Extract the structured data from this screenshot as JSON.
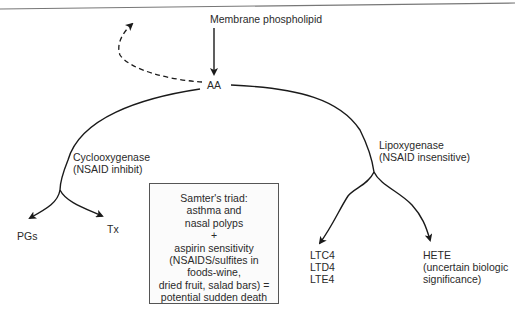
{
  "diagram": {
    "source": "Membrane phospholipid",
    "center_node": "AA",
    "left_branch": {
      "enzyme": "Cyclooxygenase",
      "note": "(NSAID inhibit)",
      "products": [
        "PGs",
        "Tx"
      ]
    },
    "right_branch": {
      "enzyme": "Lipoxygenase",
      "note": "(NSAID insensitive)",
      "products": {
        "leukotrienes": [
          "LTC4",
          "LTD4",
          "LTE4"
        ],
        "hete": {
          "name": "HETE",
          "note_line1": "(uncertain biologic",
          "note_line2": "significance)"
        }
      }
    },
    "callout_box": {
      "lines": [
        "Samter's triad:",
        "asthma and",
        "nasal polyps",
        "+",
        "aspirin sensitivity",
        "(NSAIDS/sulfites in",
        "foods-wine,",
        "dried fruit, salad bars) =",
        "potential sudden death"
      ]
    },
    "colors": {
      "line": "#1a1a1a",
      "box_border": "#555555",
      "header_rule": "#777777"
    }
  }
}
